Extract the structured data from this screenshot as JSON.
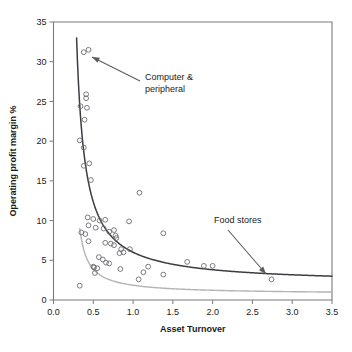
{
  "chart_data": {
    "type": "scatter",
    "title": "",
    "xlabel": "Asset Turnover",
    "ylabel": "Operating profit margin %",
    "xlim": [
      0.0,
      3.5
    ],
    "ylim": [
      0,
      35
    ],
    "grid": false,
    "legend": "none",
    "xticks": [
      "0.0",
      "0.5",
      "1.0",
      "1.5",
      "2.0",
      "2.5",
      "3.0",
      "3.5"
    ],
    "xtick_values": [
      0.0,
      0.5,
      1.0,
      1.5,
      2.0,
      2.5,
      3.0,
      3.5
    ],
    "yticks": [
      "0",
      "5",
      "10",
      "15",
      "20",
      "25",
      "30",
      "35"
    ],
    "ytick_values": [
      0,
      5,
      10,
      15,
      20,
      25,
      30,
      35
    ],
    "marker": "open-circle",
    "marker_color": "#6d6d72",
    "points": [
      [
        0.38,
        31.2
      ],
      [
        0.44,
        31.5
      ],
      [
        0.41,
        25.9
      ],
      [
        0.41,
        25.4
      ],
      [
        0.34,
        24.4
      ],
      [
        0.42,
        24.2
      ],
      [
        0.39,
        22.7
      ],
      [
        0.33,
        20.1
      ],
      [
        0.38,
        19.2
      ],
      [
        0.38,
        16.9
      ],
      [
        0.45,
        17.2
      ],
      [
        0.47,
        15.1
      ],
      [
        1.08,
        13.5
      ],
      [
        0.43,
        10.4
      ],
      [
        0.5,
        10.2
      ],
      [
        0.58,
        10.0
      ],
      [
        0.65,
        10.1
      ],
      [
        0.95,
        9.9
      ],
      [
        0.44,
        9.4
      ],
      [
        0.53,
        9.1
      ],
      [
        0.63,
        9.0
      ],
      [
        0.7,
        8.6
      ],
      [
        0.76,
        8.8
      ],
      [
        1.38,
        8.4
      ],
      [
        0.35,
        8.5
      ],
      [
        0.4,
        8.3
      ],
      [
        0.78,
        8.1
      ],
      [
        0.79,
        7.8
      ],
      [
        0.44,
        7.4
      ],
      [
        0.65,
        7.2
      ],
      [
        0.72,
        7.1
      ],
      [
        0.76,
        6.9
      ],
      [
        0.85,
        6.4
      ],
      [
        0.96,
        6.4
      ],
      [
        0.83,
        5.9
      ],
      [
        0.88,
        6.0
      ],
      [
        0.57,
        5.4
      ],
      [
        0.62,
        5.1
      ],
      [
        0.66,
        4.7
      ],
      [
        0.7,
        4.6
      ],
      [
        1.68,
        4.8
      ],
      [
        1.89,
        4.3
      ],
      [
        2.0,
        4.3
      ],
      [
        0.5,
        4.2
      ],
      [
        0.51,
        4.1
      ],
      [
        0.55,
        4.0
      ],
      [
        0.84,
        3.9
      ],
      [
        1.19,
        4.2
      ],
      [
        0.52,
        3.4
      ],
      [
        1.13,
        3.5
      ],
      [
        1.38,
        3.2
      ],
      [
        1.07,
        2.6
      ],
      [
        2.74,
        2.6
      ],
      [
        0.33,
        1.8
      ]
    ],
    "curves": [
      {
        "name": "Computer & peripheral trend",
        "color": "#3c3c42",
        "style": "solid",
        "x_start": 0.29,
        "x_end": 3.5,
        "y_start": 33.0,
        "y_end": 3.0,
        "shape": "hyperbolic-decay"
      },
      {
        "name": "Food stores trend",
        "color": "#b4b4b8",
        "style": "solid",
        "x_start": 0.33,
        "x_end": 3.5,
        "y_start": 9.0,
        "y_end": 1.0,
        "shape": "hyperbolic-decay"
      }
    ],
    "annotations": [
      {
        "label_line1": "Computer &",
        "label_line2": "peripheral",
        "text_x": 145,
        "text_y": 80,
        "arrow_from_x": 140,
        "arrow_from_y": 81,
        "arrow_to_x": 92,
        "arrow_to_y": 57
      },
      {
        "label_line1": "Food stores",
        "label_line2": "",
        "text_x": 214,
        "text_y": 223,
        "arrow_from_x": 228,
        "arrow_from_y": 230,
        "arrow_to_x": 266,
        "arrow_to_y": 274
      }
    ]
  }
}
